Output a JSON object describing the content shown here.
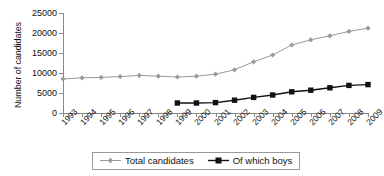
{
  "chart_data": {
    "type": "line",
    "title": "",
    "xlabel": "",
    "ylabel": "Number of candidates",
    "categories": [
      "1993",
      "1994",
      "1995",
      "1996",
      "1997",
      "1998",
      "1999",
      "2000",
      "2001",
      "2002",
      "2003",
      "2004",
      "2005",
      "2006",
      "2007",
      "2008",
      "2009"
    ],
    "ylim": [
      0,
      25000
    ],
    "yticks": [
      0,
      5000,
      10000,
      15000,
      20000,
      25000
    ],
    "ytick_labels": [
      "0",
      "5000",
      "10000",
      "15000",
      "20000",
      "25000"
    ],
    "grid": false,
    "legend_position": "bottom",
    "series": [
      {
        "name": "Total candidates",
        "color": "#9a9a9a",
        "marker": "diamond",
        "values": [
          8500,
          8800,
          8900,
          9100,
          9400,
          9200,
          9000,
          9200,
          9700,
          10800,
          12800,
          14500,
          17000,
          18300,
          19300,
          20400,
          21200
        ]
      },
      {
        "name": "Of which boys",
        "color": "#111111",
        "marker": "square",
        "values": [
          null,
          null,
          null,
          null,
          null,
          null,
          2500,
          2500,
          2600,
          3200,
          3900,
          4500,
          5300,
          5700,
          6300,
          6900,
          7100
        ]
      }
    ]
  },
  "axis": {
    "y_title": "Number of candidates"
  },
  "legend": {
    "items": [
      {
        "label": "Total candidates"
      },
      {
        "label": "Of which boys"
      }
    ]
  }
}
